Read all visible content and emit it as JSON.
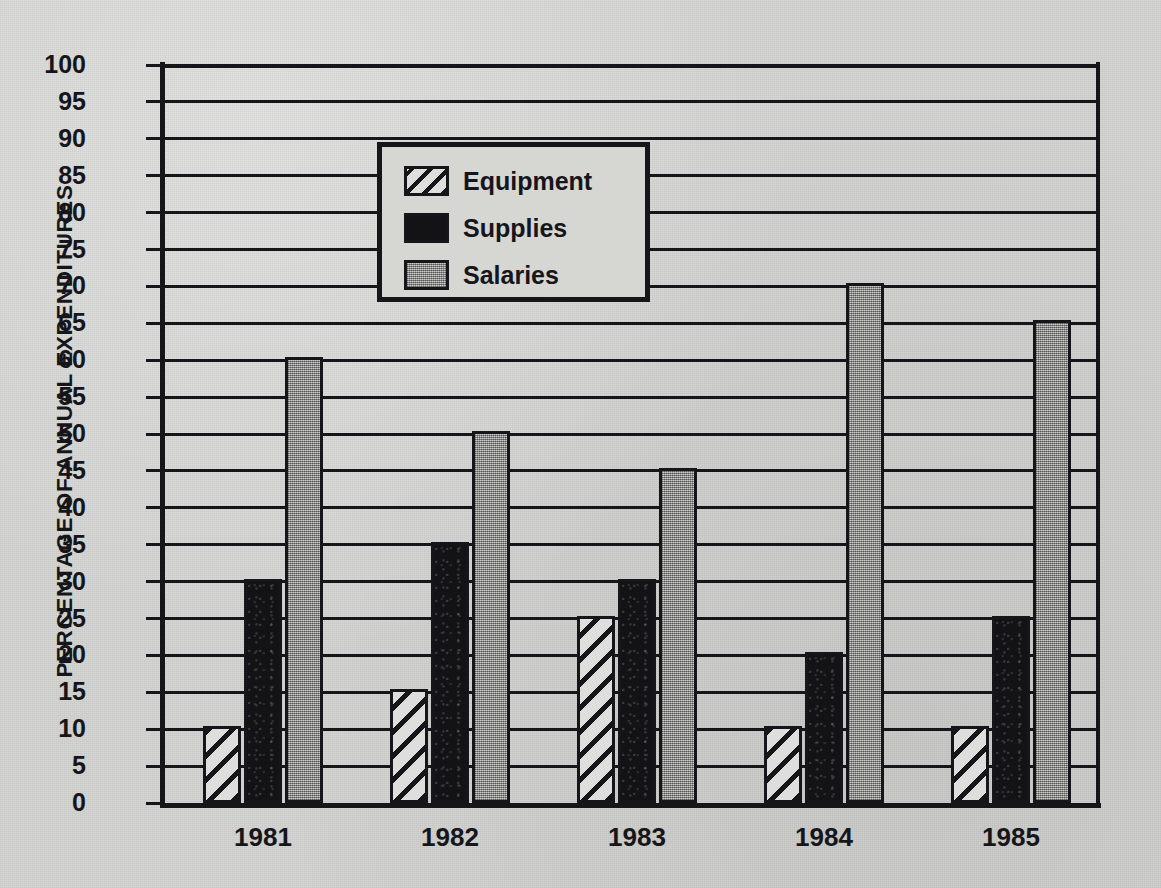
{
  "chart_data": {
    "type": "bar",
    "title": "",
    "subtitle": "",
    "xlabel": "",
    "ylabel": "PERCENTAGE OF ANNUAL EXPENDITURES",
    "categories": [
      "1981",
      "1982",
      "1983",
      "1984",
      "1985"
    ],
    "series": [
      {
        "name": "Equipment",
        "values": [
          10,
          15,
          25,
          10,
          10
        ],
        "fill": "diagonal-hatch",
        "color": "#dededc"
      },
      {
        "name": "Supplies",
        "values": [
          30,
          35,
          30,
          20,
          25
        ],
        "fill": "solid-black",
        "color": "#131316"
      },
      {
        "name": "Salaries",
        "values": [
          60,
          50,
          45,
          70,
          65
        ],
        "fill": "gray-screen",
        "color": "#a7a7a5"
      }
    ],
    "ylim": [
      0,
      100
    ],
    "ytick_step": 5,
    "yticks": [
      0,
      5,
      10,
      15,
      20,
      25,
      30,
      35,
      40,
      45,
      50,
      55,
      60,
      65,
      70,
      75,
      80,
      85,
      90,
      95,
      100
    ],
    "ytick_labels": [
      "0",
      "5",
      "10",
      "15",
      "20",
      "25",
      "30",
      "35",
      "40",
      "45",
      "50",
      "55",
      "60",
      "65",
      "70",
      "75",
      "80",
      "85",
      "90",
      "95",
      "100"
    ],
    "grid": true,
    "grid_axis": "y",
    "legend_position": "upper-left-inside",
    "legend_entries": [
      "Equipment",
      "Supplies",
      "Salaries"
    ],
    "annotations": []
  },
  "colors": {
    "paper": "#d4d4d2",
    "ink": "#16161a",
    "equipment": "#dededc",
    "supplies": "#131316",
    "salaries": "#a7a7a5"
  }
}
